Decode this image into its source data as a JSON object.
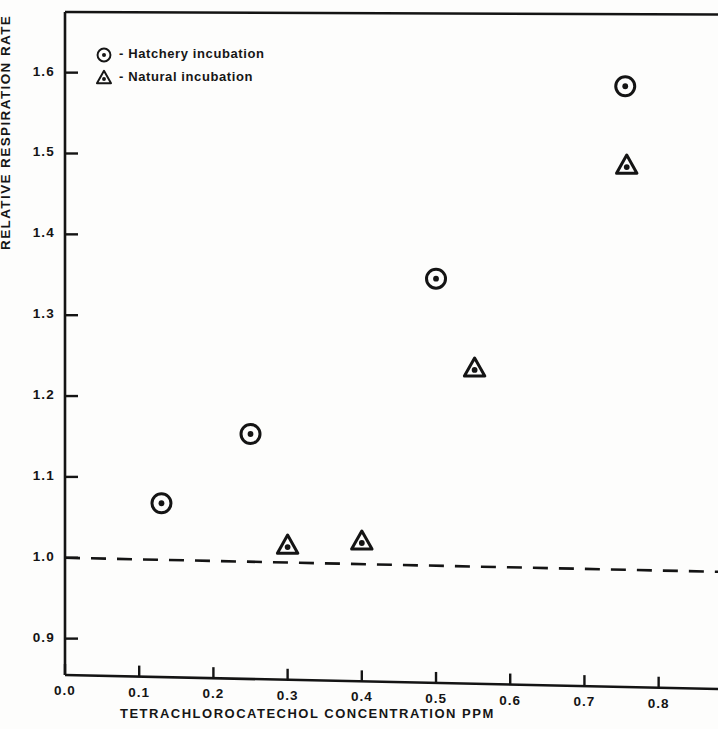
{
  "chart_data": {
    "type": "scatter",
    "title": "",
    "xlabel": "TETRACHLOROCATECHOL  CONCENTRATION  PPM",
    "ylabel": "RELATIVE  RESPIRATION  RATE",
    "xlim": [
      0.0,
      0.88
    ],
    "ylim": [
      0.855,
      1.675
    ],
    "grid": false,
    "legend_position": "top-left",
    "xticks": [
      "0.0",
      "0.1",
      "0.2",
      "0.3",
      "0.4",
      "0.5",
      "0.6",
      "0.7",
      "0.8"
    ],
    "xtick_values": [
      0.0,
      0.1,
      0.2,
      0.3,
      0.4,
      0.5,
      0.6,
      0.7,
      0.8
    ],
    "yticks": [
      "0.9",
      "1.0",
      "1.1",
      "1.2",
      "1.3",
      "1.4",
      "1.5",
      "1.6"
    ],
    "ytick_values": [
      0.9,
      1.0,
      1.1,
      1.2,
      1.3,
      1.4,
      1.5,
      1.6
    ],
    "reference_line": {
      "y": 1.0,
      "style": "dashed"
    },
    "series": [
      {
        "name": "Hatchery incubation",
        "marker": "circle-dot",
        "points": [
          {
            "x": 0.13,
            "y": 1.07
          },
          {
            "x": 0.25,
            "y": 1.158
          },
          {
            "x": 0.5,
            "y": 1.355
          },
          {
            "x": 0.755,
            "y": 1.598
          }
        ]
      },
      {
        "name": "Natural incubation",
        "marker": "triangle-dot",
        "points": [
          {
            "x": 0.3,
            "y": 1.021
          },
          {
            "x": 0.4,
            "y": 1.028
          },
          {
            "x": 0.552,
            "y": 1.245
          },
          {
            "x": 0.757,
            "y": 1.5
          }
        ]
      }
    ]
  },
  "legend": {
    "items": [
      {
        "marker": "circle-dot-icon",
        "dash": "-",
        "label": "Hatchery incubation"
      },
      {
        "marker": "triangle-dot-icon",
        "dash": "-",
        "label": "Natural incubation"
      }
    ]
  },
  "colors": {
    "ink": "#161616",
    "axis": "#141414",
    "background": "#fdfdfc"
  }
}
